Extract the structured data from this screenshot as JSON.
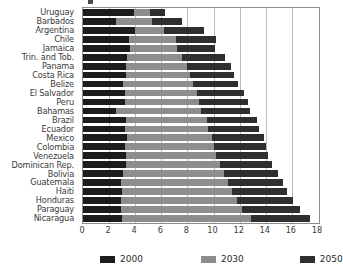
{
  "chart_data": {
    "type": "bar",
    "orientation": "horizontal",
    "title": "",
    "xlabel": "",
    "ylabel": "",
    "xlim": [
      0,
      18
    ],
    "xticks": [
      "0",
      "2",
      "4",
      "6",
      "8",
      "10",
      "12",
      "14",
      "16",
      "18"
    ],
    "grid": true,
    "legend_position": "bottom",
    "bar_mode": "overlap",
    "categories": [
      "Uruguay",
      "Barbados",
      "Argentina",
      "Chile",
      "Jamaica",
      "Trin. and Tob.",
      "Panama",
      "Costa Rica",
      "Belize",
      "El Salvador",
      "Peru",
      "Bahamas",
      "Brazil",
      "Ecuador",
      "Mexico",
      "Colombia",
      "Venezuela",
      "Dominican Rep.",
      "Bolivia",
      "Guatemala",
      "Haiti",
      "Honduras",
      "Paraguay",
      "Nicaragua"
    ],
    "series": [
      {
        "name": "2000",
        "color": "#1c1c1c",
        "values": [
          3.9,
          2.5,
          4.0,
          3.5,
          3.6,
          3.4,
          3.3,
          3.3,
          3.1,
          3.2,
          3.2,
          2.5,
          3.3,
          3.2,
          3.4,
          3.2,
          3.3,
          3.3,
          3.1,
          2.9,
          3.0,
          2.9,
          2.9,
          3.0
        ],
        "values_px_end": [
          41,
          26,
          42,
          37,
          38,
          36,
          35,
          35,
          33,
          34,
          34,
          26,
          35,
          34,
          36,
          34,
          35,
          35,
          33,
          31,
          32,
          31,
          31,
          32
        ]
      },
      {
        "name": "2030",
        "color": "#8d8d8d",
        "values": [
          5.1,
          5.3,
          6.2,
          7.1,
          7.2,
          7.6,
          8.0,
          8.2,
          8.4,
          8.7,
          8.9,
          9.0,
          9.5,
          9.6,
          9.9,
          10.0,
          10.2,
          10.5,
          10.8,
          11.1,
          11.4,
          11.8,
          12.2,
          12.9
        ],
        "values_px_end": [
          54,
          56,
          65,
          75,
          76,
          80,
          84,
          86,
          89,
          92,
          94,
          95,
          100,
          101,
          105,
          106,
          108,
          111,
          114,
          117,
          121,
          125,
          129,
          136
        ]
      },
      {
        "name": "2050",
        "color": "#2f2f2f",
        "values": [
          6.3,
          7.6,
          9.3,
          10.2,
          10.1,
          10.9,
          11.3,
          11.6,
          11.9,
          12.3,
          12.6,
          12.8,
          13.3,
          13.5,
          13.9,
          14.0,
          14.2,
          14.5,
          14.9,
          15.3,
          15.6,
          16.1,
          16.6,
          17.4
        ],
        "values_px_end": [
          67,
          80,
          98,
          108,
          107,
          115,
          119,
          123,
          126,
          130,
          133,
          135,
          141,
          143,
          147,
          148,
          150,
          153,
          158,
          162,
          165,
          170,
          176,
          184
        ]
      }
    ]
  },
  "legend": {
    "items": [
      {
        "label": "2000",
        "color": "#1c1c1c"
      },
      {
        "label": "2030",
        "color": "#8d8d8d"
      },
      {
        "label": "2050",
        "color": "#2f2f2f"
      }
    ]
  },
  "axis": {
    "x_ticks": [
      "0",
      "2",
      "4",
      "6",
      "8",
      "10",
      "12",
      "14",
      "16",
      "18"
    ]
  }
}
